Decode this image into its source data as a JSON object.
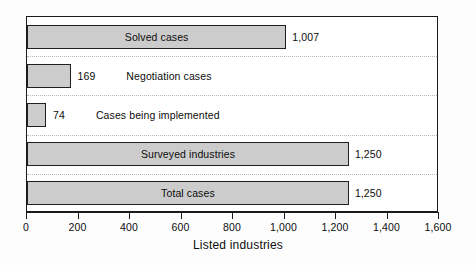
{
  "chart_data": {
    "type": "bar",
    "orientation": "horizontal",
    "title": "",
    "subtitle": "",
    "xlabel": "Listed industries",
    "ylabel": "",
    "categories": [
      "Solved cases",
      "Negotiation cases",
      "Cases being implemented",
      "Surveyed industries",
      "Total cases"
    ],
    "values": [
      1007,
      169,
      74,
      1250,
      1250
    ],
    "value_labels": [
      "1,007",
      "169",
      "74",
      "1,250",
      "1,250"
    ],
    "label_placement": [
      "inside",
      "outside",
      "outside",
      "inside",
      "inside"
    ],
    "xlim": [
      0,
      1600
    ],
    "xticks": [
      0,
      200,
      400,
      600,
      800,
      1000,
      1200,
      1400,
      1600
    ],
    "xtick_labels": [
      "0",
      "200",
      "400",
      "600",
      "800",
      "1,000",
      "1,200",
      "1,400",
      "1,600"
    ],
    "grid": true,
    "legend": null,
    "legend_position": "none",
    "colors": {
      "bar_fill": "#cccccc",
      "bar_border": "#1f1f1f",
      "axis": "#1a1a1a",
      "grid": "#b9b9b9",
      "text": "#0d0d0d",
      "background": "#ffffff"
    }
  }
}
